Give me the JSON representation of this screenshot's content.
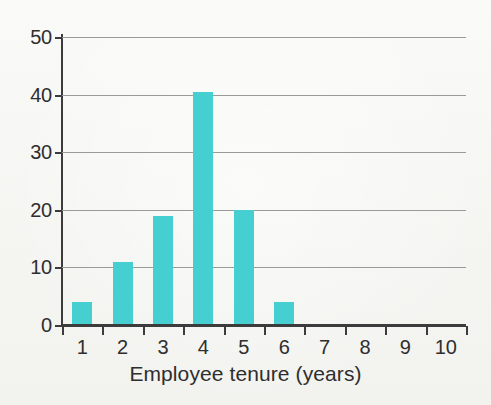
{
  "chart_data": {
    "type": "bar",
    "title": "",
    "subtitle": "",
    "xlabel": "Employee tenure (years)",
    "ylabel": "",
    "categories": [
      "1",
      "2",
      "3",
      "4",
      "5",
      "6",
      "7",
      "8",
      "9",
      "10"
    ],
    "values": [
      4,
      11,
      19,
      40.5,
      20,
      4,
      0,
      0,
      0,
      0
    ],
    "series": [
      {
        "name": "Employee count",
        "values": [
          4,
          11,
          19,
          40.5,
          20,
          4,
          0,
          0,
          0,
          0
        ]
      }
    ],
    "ylim": [
      0,
      50
    ],
    "yticks": [
      0,
      10,
      20,
      30,
      40,
      50
    ],
    "ytick_labels": [
      "0",
      "10",
      "20",
      "30",
      "40",
      "50"
    ],
    "xtick_labels": [
      "1",
      "2",
      "3",
      "4",
      "5",
      "6",
      "7",
      "8",
      "9",
      "10"
    ],
    "grid": true,
    "grid_axis": "y",
    "legend": false,
    "legend_position": "none",
    "bar_color": "#45cfd0",
    "axis_color": "#3c3c3c",
    "gridline_color": "#9a9a9a",
    "background_color": "#f7f7f5",
    "text_color": "#2e2e2e",
    "annotations": []
  },
  "figure": {
    "caption": "",
    "x_axis_title": "Employee tenure (years)"
  }
}
